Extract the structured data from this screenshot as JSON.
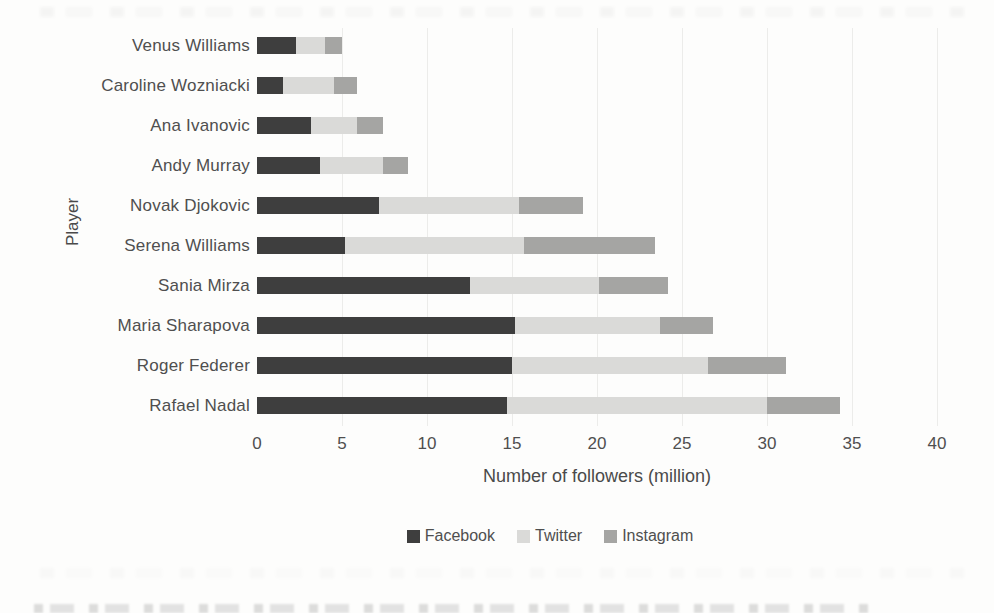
{
  "chart_data": {
    "type": "bar",
    "orientation": "horizontal",
    "stacked": true,
    "title": "",
    "xlabel": "Number of followers (million)",
    "ylabel": "Player",
    "xlim": [
      0,
      40
    ],
    "xticks": [
      0,
      5,
      10,
      15,
      20,
      25,
      30,
      35,
      40
    ],
    "grid": "faint-vertical",
    "legend_position": "bottom-center",
    "categories": [
      "Venus Williams",
      "Caroline Wozniacki",
      "Ana Ivanovic",
      "Andy Murray",
      "Novak Djokovic",
      "Serena Williams",
      "Sania Mirza",
      "Maria Sharapova",
      "Roger Federer",
      "Rafael Nadal"
    ],
    "series": [
      {
        "name": "Facebook",
        "color": "#3e3e3e",
        "values": [
          2.3,
          1.5,
          3.2,
          3.7,
          7.2,
          5.2,
          12.5,
          15.2,
          15.0,
          14.7
        ]
      },
      {
        "name": "Twitter",
        "color": "#dadad8",
        "values": [
          1.7,
          3.0,
          2.7,
          3.7,
          8.2,
          10.5,
          7.6,
          8.5,
          11.5,
          15.3
        ]
      },
      {
        "name": "Instagram",
        "color": "#a5a5a3",
        "values": [
          1.0,
          1.4,
          1.5,
          1.5,
          3.8,
          7.7,
          4.1,
          3.1,
          4.6,
          4.3
        ]
      }
    ],
    "totals": [
      5.0,
      5.9,
      7.4,
      8.9,
      19.2,
      23.4,
      24.2,
      26.8,
      31.1,
      34.3
    ]
  },
  "colors": {
    "background": "#fdfdfc",
    "text": "#4f4f4f",
    "gridline": "#ececea"
  }
}
